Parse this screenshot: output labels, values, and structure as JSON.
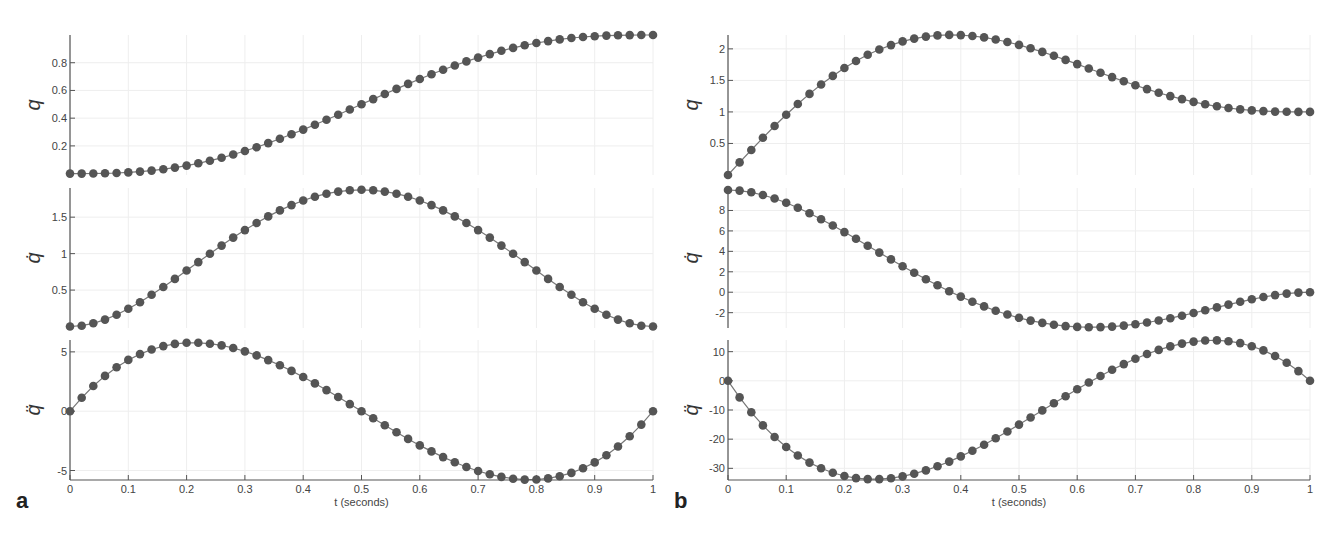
{
  "figure": {
    "panels": [
      {
        "label": "a",
        "xlabel": "t (seconds)"
      },
      {
        "label": "b",
        "xlabel": "t (seconds)"
      }
    ],
    "colors": {
      "marker": "#555555",
      "line": "#777777",
      "axis": "#555555",
      "grid": "#eeeeee",
      "text": "#444444"
    }
  },
  "chart_data": [
    {
      "type": "line",
      "panel": "a",
      "title": "",
      "xlabel": "t (seconds)",
      "x_ticks": [
        0,
        0.1,
        0.2,
        0.3,
        0.4,
        0.5,
        0.6,
        0.7,
        0.8,
        0.9,
        1
      ],
      "xlim": [
        0,
        1
      ],
      "grid": true,
      "x": [
        0,
        0.02,
        0.04,
        0.06,
        0.08,
        0.1,
        0.12,
        0.14,
        0.16,
        0.18,
        0.2,
        0.22,
        0.24,
        0.26,
        0.28,
        0.3,
        0.32,
        0.34,
        0.36,
        0.38,
        0.4,
        0.42,
        0.44,
        0.46,
        0.48,
        0.5,
        0.52,
        0.54,
        0.56,
        0.58,
        0.6,
        0.62,
        0.64,
        0.66,
        0.68,
        0.7,
        0.72,
        0.74,
        0.76,
        0.78,
        0.8,
        0.82,
        0.84,
        0.86,
        0.88,
        0.9,
        0.92,
        0.94,
        0.96,
        0.98,
        1
      ],
      "series": [
        {
          "name": "q",
          "ylabel": "q",
          "y_ticks": [
            0.2,
            0.4,
            0.6,
            0.8
          ],
          "ylim": [
            -0.01,
            1.0
          ],
          "values": [
            0,
            0.0001,
            0.0006,
            0.0019,
            0.0043,
            0.0086,
            0.0143,
            0.0221,
            0.0322,
            0.0446,
            0.0579,
            0.0751,
            0.0935,
            0.1136,
            0.1353,
            0.1631,
            0.1891,
            0.2161,
            0.2441,
            0.2727,
            0.3174,
            0.3459,
            0.3746,
            0.4035,
            0.4324,
            0.5,
            0.5676,
            0.5965,
            0.6254,
            0.6541,
            0.6826,
            0.7273,
            0.7559,
            0.7839,
            0.8109,
            0.8369,
            0.8647,
            0.8864,
            0.9065,
            0.9249,
            0.9421,
            0.9554,
            0.9678,
            0.9779,
            0.9857,
            0.9914,
            0.9957,
            0.9981,
            0.9994,
            0.9999,
            1
          ]
        },
        {
          "name": "qdot",
          "ylabel": "q̇",
          "y_ticks": [
            0.5,
            1,
            1.5
          ],
          "ylim": [
            -0.02,
            1.9
          ],
          "values": [
            0,
            0.0113,
            0.0424,
            0.0896,
            0.1497,
            0.2187,
            0.2946,
            0.3753,
            0.4584,
            0.5425,
            0.6226,
            0.7019,
            0.7783,
            0.8498,
            0.9163,
            0.9774,
            1.0367,
            1.0907,
            1.1393,
            1.1822,
            1.2192,
            1.2503,
            1.2755,
            1.2948,
            1.3084,
            1.875,
            1.8684,
            1.8544,
            1.8326,
            1.8027,
            1.728,
            1.6624,
            1.5866,
            1.5017,
            1.4081,
            1.3232,
            1.2133,
            1.0972,
            0.9772,
            0.8557,
            0.768,
            0.6398,
            0.5168,
            0.4007,
            0.2946,
            0.2187,
            0.1497,
            0.0896,
            0.0424,
            0.0113,
            0
          ]
        },
        {
          "name": "qddot",
          "ylabel": "q̈",
          "y_ticks": [
            -5,
            0,
            5
          ],
          "ylim": [
            -5.8,
            6.0
          ],
          "values": [
            0,
            1.1059,
            2.0858,
            2.9433,
            3.6834,
            4.32,
            4.8384,
            5.2554,
            5.5706,
            5.7868,
            5.76,
            5.7735,
            5.6755,
            5.4935,
            5.2321,
            4.62,
            4.5289,
            4.1238,
            3.6708,
            3.1759,
            2.88,
            2.0947,
            1.5383,
            0.9607,
            0.3776,
            0,
            -0.3776,
            -0.9607,
            -1.5383,
            -2.0947,
            -2.88,
            -3.1759,
            -3.6708,
            -4.1238,
            -4.5289,
            -4.62,
            -5.2321,
            -5.4935,
            -5.6755,
            -5.7735,
            -5.76,
            -5.7868,
            -5.5706,
            -5.2554,
            -4.8384,
            -4.32,
            -3.6834,
            -2.9433,
            -2.0858,
            -1.1059,
            0
          ]
        }
      ]
    },
    {
      "type": "line",
      "panel": "b",
      "title": "",
      "xlabel": "t (seconds)",
      "x_ticks": [
        0,
        0.1,
        0.2,
        0.3,
        0.4,
        0.5,
        0.6,
        0.7,
        0.8,
        0.9,
        1
      ],
      "xlim": [
        0,
        1
      ],
      "grid": true,
      "x": [
        0,
        0.02,
        0.04,
        0.06,
        0.08,
        0.1,
        0.12,
        0.14,
        0.16,
        0.18,
        0.2,
        0.22,
        0.24,
        0.26,
        0.28,
        0.3,
        0.32,
        0.34,
        0.36,
        0.38,
        0.4,
        0.42,
        0.44,
        0.46,
        0.48,
        0.5,
        0.52,
        0.54,
        0.56,
        0.58,
        0.6,
        0.62,
        0.64,
        0.66,
        0.68,
        0.7,
        0.72,
        0.74,
        0.76,
        0.78,
        0.8,
        0.82,
        0.84,
        0.86,
        0.88,
        0.9,
        0.92,
        0.94,
        0.96,
        0.98,
        1
      ],
      "series": [
        {
          "name": "q",
          "ylabel": "q",
          "y_ticks": [
            0.5,
            1,
            1.5,
            2
          ],
          "ylim": [
            0,
            2.22
          ],
          "values": [
            0,
            0.1996,
            0.397,
            0.5899,
            0.7767,
            0.9557,
            1.1257,
            1.2854,
            1.4339,
            1.5705,
            1.6946,
            1.8058,
            1.9039,
            1.9889,
            2.0608,
            2.1198,
            2.1662,
            2.2005,
            2.2231,
            2.2346,
            2.2355,
            2.2266,
            2.2087,
            2.1825,
            2.149,
            2.1094,
            2.0645,
            2.0156,
            1.9637,
            1.9099,
            1.8554,
            1.8012,
            1.7483,
            1.6975,
            1.6497,
            1.6055,
            1.5655,
            1.5299,
            1.499,
            1.4728,
            1.4512,
            1.4339,
            1.4205,
            1.4104,
            1.4031,
            1.398,
            1.3946,
            1.3925,
            1.3913,
            1.3908,
            1.3906
          ]
        },
        {
          "name": "qdot",
          "ylabel": "q̇",
          "y_ticks": [
            -2,
            0,
            2,
            4,
            6,
            8
          ],
          "ylim": [
            -3.5,
            10.2
          ],
          "values": [
            10,
            9.9419,
            9.7761,
            9.515,
            9.1716,
            8.76,
            8.2938,
            7.7873,
            7.2545,
            6.7093,
            6.16,
            5.6189,
            5.0926,
            4.5882,
            4.1138,
            3.67,
            3.262,
            2.8925,
            2.564,
            2.2771,
            2.032,
            1.8268,
            1.6595,
            1.5266,
            1.4234,
            1.3438,
            1.2814,
            1.229,
            1.1787,
            1.1219,
            1.0496,
            0.9521,
            0.8195,
            0.6414,
            0.4071,
            0.1052,
            -0.2764,
            -0.7494,
            -1.325,
            -2.0148,
            -2.832,
            -3.79,
            -4.9,
            -6.18,
            -7.64,
            -9.29,
            -11.14,
            -13.2,
            -15.5,
            -18.0,
            -20.8
          ]
        },
        {
          "name": "qddot",
          "ylabel": "q̈",
          "y_ticks": [
            -30,
            -20,
            -10,
            0,
            10
          ],
          "ylim": [
            -34,
            14
          ],
          "values": [
            0,
            -5.69,
            -10.78,
            -15.31,
            -19.28,
            -22.72,
            -25.65,
            -28.09,
            -30.06,
            -31.58,
            -32.68,
            -33.37,
            -33.68,
            -33.63,
            -33.25,
            -32.56,
            -31.59,
            -30.35,
            -28.88,
            -27.2,
            -25.32,
            -23.28,
            -21.1,
            -18.8,
            -16.4,
            -13.93,
            -11.42,
            -8.88,
            -6.34,
            -3.82,
            -1.35,
            1.05,
            3.36,
            5.55,
            7.6,
            9.48,
            11.17,
            12.65,
            13.89,
            14.86,
            15.54,
            15.9,
            15.91,
            15.55,
            14.8,
            13.62,
            11.98,
            9.87,
            7.24,
            4.08,
            0
          ]
        }
      ]
    }
  ]
}
